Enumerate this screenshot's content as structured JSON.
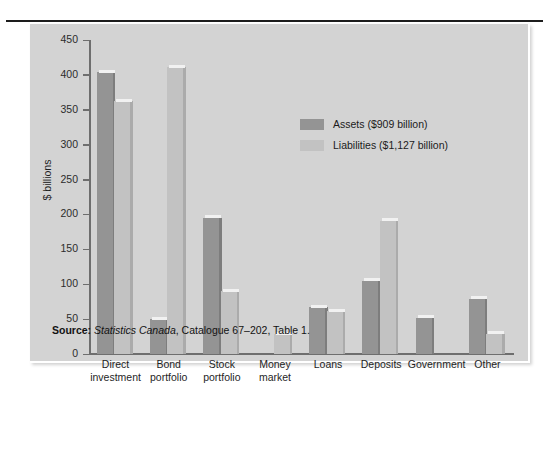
{
  "figure": {
    "background": "#ffffff",
    "panel_color": "#d3d3d3",
    "rule_color": "#1d1d1d"
  },
  "source_note": {
    "label": "Source:",
    "publisher": "Statistics Canada",
    "rest": ", Catalogue 67–202, Table 1."
  },
  "chart_data": {
    "type": "bar",
    "title": "",
    "xlabel": "",
    "ylabel": "$ billions",
    "ylim": [
      0,
      450
    ],
    "yticks": [
      0,
      50,
      100,
      150,
      200,
      250,
      300,
      350,
      400,
      450
    ],
    "grid": false,
    "legend_position": "upper-right-inside",
    "categories": [
      "Direct\ninvestment",
      "Bond\nportfolio",
      "Stock\nportfolio",
      "Money\nmarket",
      "Loans",
      "Deposits",
      "Government",
      "Other"
    ],
    "category_lines": [
      [
        "Direct",
        "investment"
      ],
      [
        "Bond",
        "portfolio"
      ],
      [
        "Stock",
        "portfolio"
      ],
      [
        "Money",
        "market"
      ],
      [
        "Loans",
        ""
      ],
      [
        "Deposits",
        ""
      ],
      [
        "Government",
        ""
      ],
      [
        "Other",
        ""
      ]
    ],
    "series": [
      {
        "name": "Assets ($909 billion)",
        "color": "#949494",
        "values": [
          404,
          50,
          195,
          1,
          67,
          105,
          52,
          79
        ]
      },
      {
        "name": "Liabilities ($1,127 billion)",
        "color": "#c2c2c2",
        "values": [
          362,
          411,
          90,
          28,
          61,
          191,
          0,
          29
        ]
      }
    ]
  }
}
